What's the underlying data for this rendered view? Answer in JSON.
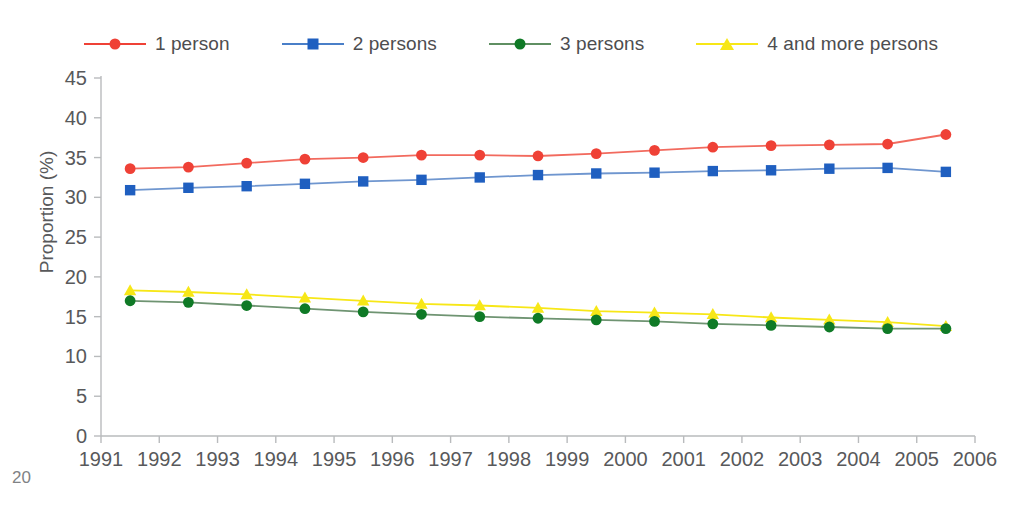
{
  "page": {
    "number": "20"
  },
  "legend": {
    "position": "top-center",
    "entries": [
      {
        "label": "1 person",
        "color": "#ef4136",
        "marker": "circle",
        "marker_name": "legend-marker-circle-red"
      },
      {
        "label": "2 persons",
        "color": "#1f5fc0",
        "marker": "square",
        "marker_name": "legend-marker-square-blue"
      },
      {
        "label": "3 persons",
        "color": "#0f7a26",
        "marker": "circle",
        "marker_name": "legend-marker-circle-green"
      },
      {
        "label": "4 and more persons",
        "color": "#f7e717",
        "marker": "triangle",
        "marker_name": "legend-marker-triangle-yellow"
      }
    ]
  },
  "chart_data": {
    "type": "line",
    "title": "",
    "xlabel": "",
    "ylabel": "Proportion (%)",
    "xlim": [
      1991,
      2006
    ],
    "ylim": [
      0,
      45
    ],
    "ytick_step": 5,
    "grid": false,
    "legend_position": "top-center",
    "x": [
      1991.5,
      1992.5,
      1993.5,
      1994.5,
      1995.5,
      1996.5,
      1997.5,
      1998.5,
      1999.5,
      2000.5,
      2001.5,
      2002.5,
      2003.5,
      2004.5,
      2005.5
    ],
    "xtick_labels": [
      "1991",
      "1992",
      "1993",
      "1994",
      "1995",
      "1996",
      "1997",
      "1998",
      "1999",
      "2000",
      "2001",
      "2002",
      "2003",
      "2004",
      "2005",
      "2006"
    ],
    "ytick_labels": [
      "0",
      "5",
      "10",
      "15",
      "20",
      "25",
      "30",
      "35",
      "40",
      "45"
    ],
    "series": [
      {
        "name": "1 person",
        "color": "#ef4136",
        "marker": "circle",
        "values": [
          33.6,
          33.8,
          34.3,
          34.8,
          35.0,
          35.3,
          35.3,
          35.2,
          35.5,
          35.9,
          36.3,
          36.5,
          36.6,
          36.7,
          37.9
        ]
      },
      {
        "name": "2 persons",
        "color": "#1f5fc0",
        "marker": "square",
        "values": [
          30.9,
          31.2,
          31.4,
          31.7,
          32.0,
          32.2,
          32.5,
          32.8,
          33.0,
          33.1,
          33.3,
          33.4,
          33.6,
          33.7,
          33.2
        ]
      },
      {
        "name": "3 persons",
        "color": "#0f7a26",
        "marker": "circle",
        "values": [
          17.0,
          16.8,
          16.4,
          16.0,
          15.6,
          15.3,
          15.0,
          14.8,
          14.6,
          14.4,
          14.1,
          13.9,
          13.7,
          13.5,
          13.5
        ]
      },
      {
        "name": "4 and more persons",
        "color": "#f7e717",
        "marker": "triangle",
        "values": [
          18.3,
          18.1,
          17.8,
          17.4,
          17.0,
          16.6,
          16.4,
          16.1,
          15.7,
          15.5,
          15.3,
          14.9,
          14.6,
          14.3,
          13.8
        ]
      }
    ]
  }
}
